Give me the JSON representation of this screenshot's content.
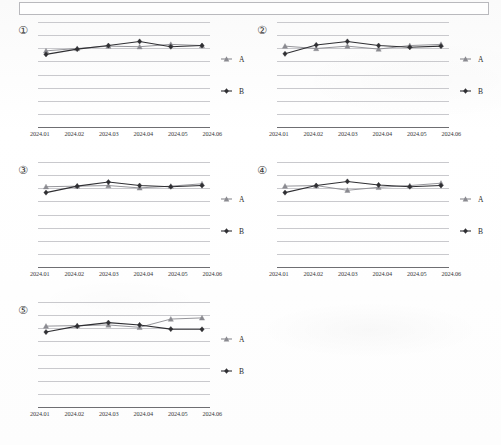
{
  "document": {
    "type": "scanned-report-page",
    "top_box": {
      "present": true,
      "content": ""
    }
  },
  "legend": {
    "series_a_label": "A",
    "series_b_label": "B",
    "series_a_marker": "triangle-marker-icon",
    "series_b_marker": "diamond-marker-icon"
  },
  "colors": {
    "series_a": "#8a8a90",
    "series_b": "#2f2f33",
    "gridline": "#c9c9cd",
    "axis": "#6e6e72",
    "text": "#2b2b2b"
  },
  "chart_data": [
    {
      "type": "line",
      "title": "①",
      "xlabel": "",
      "ylabel": "",
      "grid": true,
      "legend_position": "right",
      "ylim": [
        0,
        9
      ],
      "categories": [
        "2024.01",
        "2024.02",
        "2024.03",
        "2024.04",
        "2024.05",
        "2024.06"
      ],
      "series": [
        {
          "name": "A",
          "values": [
            6.55,
            6.75,
            6.95,
            6.9,
            7.1,
            7.0
          ]
        },
        {
          "name": "B",
          "values": [
            6.25,
            6.7,
            7.0,
            7.35,
            6.9,
            7.0
          ]
        }
      ]
    },
    {
      "type": "line",
      "title": "②",
      "xlabel": "",
      "ylabel": "",
      "grid": true,
      "legend_position": "right",
      "ylim": [
        0,
        9
      ],
      "categories": [
        "2024.01",
        "2024.02",
        "2024.03",
        "2024.04",
        "2024.05",
        "2024.06"
      ],
      "series": [
        {
          "name": "A",
          "values": [
            6.95,
            6.75,
            6.95,
            6.7,
            7.0,
            7.1
          ]
        },
        {
          "name": "B",
          "values": [
            6.3,
            7.05,
            7.35,
            7.0,
            6.85,
            6.95
          ]
        }
      ]
    },
    {
      "type": "line",
      "title": "③",
      "xlabel": "",
      "ylabel": "",
      "grid": true,
      "legend_position": "right",
      "ylim": [
        0,
        9
      ],
      "categories": [
        "2024.01",
        "2024.02",
        "2024.03",
        "2024.04",
        "2024.05",
        "2024.06"
      ],
      "series": [
        {
          "name": "A",
          "values": [
            6.9,
            6.95,
            7.0,
            6.8,
            6.95,
            7.15
          ]
        },
        {
          "name": "B",
          "values": [
            6.4,
            6.95,
            7.3,
            7.0,
            6.9,
            7.0
          ]
        }
      ]
    },
    {
      "type": "line",
      "title": "④",
      "xlabel": "",
      "ylabel": "",
      "grid": true,
      "legend_position": "right",
      "ylim": [
        0,
        9
      ],
      "categories": [
        "2024.01",
        "2024.02",
        "2024.03",
        "2024.04",
        "2024.05",
        "2024.06"
      ],
      "series": [
        {
          "name": "A",
          "values": [
            6.95,
            7.0,
            6.6,
            6.85,
            7.0,
            7.2
          ]
        },
        {
          "name": "B",
          "values": [
            6.4,
            7.0,
            7.35,
            7.05,
            6.9,
            7.0
          ]
        }
      ]
    },
    {
      "type": "line",
      "title": "⑤",
      "xlabel": "",
      "ylabel": "",
      "grid": true,
      "legend_position": "right",
      "ylim": [
        0,
        9
      ],
      "categories": [
        "2024.01",
        "2024.02",
        "2024.03",
        "2024.04",
        "2024.05",
        "2024.06"
      ],
      "series": [
        {
          "name": "A",
          "values": [
            6.95,
            7.0,
            7.05,
            6.85,
            7.55,
            7.65
          ]
        },
        {
          "name": "B",
          "values": [
            6.45,
            6.95,
            7.25,
            7.05,
            6.7,
            6.68
          ]
        }
      ]
    }
  ]
}
